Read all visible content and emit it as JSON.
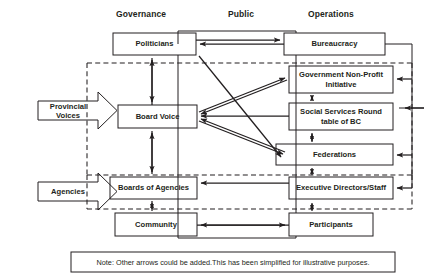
{
  "diagram": {
    "column_headers": [
      {
        "name": "governance",
        "label": "Governance"
      },
      {
        "name": "public",
        "label": "Public"
      },
      {
        "name": "operations",
        "label": "Operations"
      }
    ],
    "side_arrows": [
      {
        "name": "provincial-voices",
        "label": "Provincial Voices"
      },
      {
        "name": "agencies",
        "label": "Agencies"
      }
    ],
    "boxes": [
      {
        "name": "politicians",
        "label": "Politicians"
      },
      {
        "name": "bureaucracy",
        "label": "Bureaucracy"
      },
      {
        "name": "government-non-profit-initiative",
        "label": "Government Non-Profit Initiative"
      },
      {
        "name": "board-voice",
        "label": "Board Voice"
      },
      {
        "name": "social-services-round-table-of-bc",
        "label": "Social Services Round table of BC"
      },
      {
        "name": "federations",
        "label": "Federations"
      },
      {
        "name": "boards-of-agencies",
        "label": "Boards of Agencies"
      },
      {
        "name": "executive-directors-staff",
        "label": "Executive Directors/Staff"
      },
      {
        "name": "community",
        "label": "Community"
      },
      {
        "name": "participants",
        "label": "Participants"
      }
    ],
    "note": "Note: Other arrows could be added.This has been simplified for illustrative purposes.",
    "colors": {
      "stroke": "#231f20",
      "text": "#231f20",
      "background": "#ffffff",
      "dashed": "#555555"
    }
  }
}
